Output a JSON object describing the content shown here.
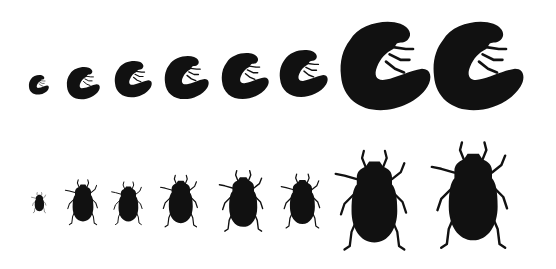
{
  "illustration": {
    "subject": "Beetle size series: larvae (grubs) and adults",
    "color": "#111111",
    "background": "#ffffff",
    "rows": [
      {
        "name": "larvae",
        "count": 8,
        "specimens": [
          {
            "label": "grub-1",
            "relative_size": 0.22
          },
          {
            "label": "grub-2",
            "relative_size": 0.33
          },
          {
            "label": "grub-3",
            "relative_size": 0.42
          },
          {
            "label": "grub-4",
            "relative_size": 0.5
          },
          {
            "label": "grub-5",
            "relative_size": 0.53
          },
          {
            "label": "grub-6",
            "relative_size": 0.55
          },
          {
            "label": "grub-7",
            "relative_size": 1.0
          },
          {
            "label": "grub-8",
            "relative_size": 0.98
          }
        ]
      },
      {
        "name": "adults",
        "count": 8,
        "specimens": [
          {
            "label": "beetle-1",
            "relative_size": 0.18
          },
          {
            "label": "beetle-2",
            "relative_size": 0.42
          },
          {
            "label": "beetle-3",
            "relative_size": 0.38
          },
          {
            "label": "beetle-4",
            "relative_size": 0.48
          },
          {
            "label": "beetle-5",
            "relative_size": 0.55
          },
          {
            "label": "beetle-6",
            "relative_size": 0.5
          },
          {
            "label": "beetle-7",
            "relative_size": 0.92
          },
          {
            "label": "beetle-8",
            "relative_size": 1.0
          }
        ]
      }
    ]
  }
}
